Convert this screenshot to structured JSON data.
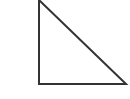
{
  "diagram": {
    "shape": "right-triangle",
    "stroke_color": "#333333",
    "fill_color": "#ffffff",
    "vertices_labels": []
  }
}
